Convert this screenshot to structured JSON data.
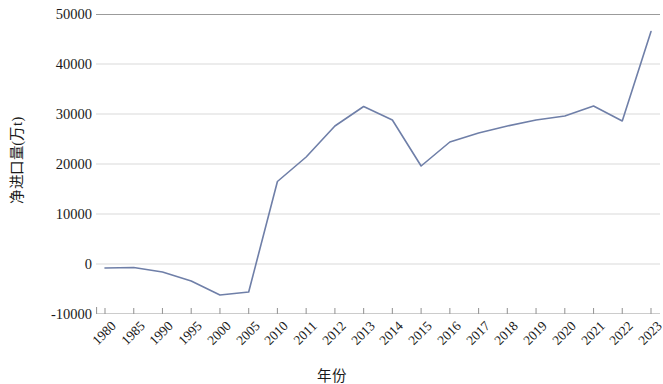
{
  "chart_data": {
    "type": "line",
    "title": "",
    "xlabel": "年份",
    "ylabel": "净进口量(万t)",
    "categories": [
      "1980",
      "1985",
      "1990",
      "1995",
      "2000",
      "2005",
      "2010",
      "2011",
      "2012",
      "2013",
      "2014",
      "2015",
      "2016",
      "2017",
      "2018",
      "2019",
      "2020",
      "2021",
      "2022",
      "2023"
    ],
    "values": [
      -800,
      -700,
      -1600,
      -3400,
      -6200,
      -5600,
      16500,
      21400,
      27600,
      31500,
      28800,
      19600,
      24400,
      26200,
      27600,
      28800,
      29600,
      31600,
      28600,
      46500
    ],
    "series": [
      {
        "name": "净进口量",
        "color": "#6f7fa8",
        "values": [
          -800,
          -700,
          -1600,
          -3400,
          -6200,
          -5600,
          16500,
          21400,
          27600,
          31500,
          28800,
          19600,
          24400,
          26200,
          27600,
          28800,
          29600,
          31600,
          28600,
          46500
        ]
      }
    ],
    "ylim": [
      -10000,
      50000
    ],
    "y_ticks": [
      50000,
      40000,
      30000,
      20000,
      10000,
      0,
      -10000
    ],
    "y_tick_labels": [
      "50000",
      "40000",
      "30000",
      "20000",
      "10000",
      "0",
      "-10000"
    ],
    "grid": true,
    "grid_axis": "y",
    "legend": "none",
    "line_width": 1.6,
    "markers": "none",
    "axis_color": "#9a9a9a",
    "grid_color": "#d9d9d9",
    "background": "#ffffff"
  }
}
